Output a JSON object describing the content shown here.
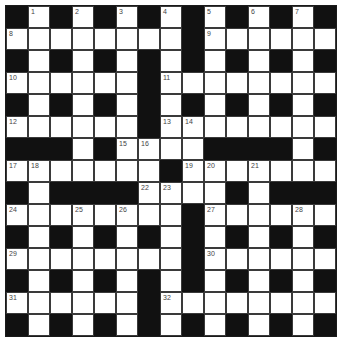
{
  "puzzle": {
    "size": 15,
    "rows": [
      "#.#.#.#.#.#.#.#",
      "........#......",
      "#.#.#.#.#.#.#.#",
      "......#........",
      "#.#.#.#.#.#.#.#",
      "......#........",
      "###.#....####.#",
      ".......#.......",
      "#.####....#.###",
      "........#......",
      "#.#.#.#.#.#.#.#",
      "........#......",
      "#.#.#.#.#.#.#.#",
      "......#........",
      "#.#.#.#.#.#.#.#"
    ],
    "numbers": [
      {
        "r": 0,
        "c": 1,
        "n": "1"
      },
      {
        "r": 0,
        "c": 3,
        "n": "2"
      },
      {
        "r": 0,
        "c": 5,
        "n": "3"
      },
      {
        "r": 0,
        "c": 7,
        "n": "4"
      },
      {
        "r": 0,
        "c": 9,
        "n": "5"
      },
      {
        "r": 0,
        "c": 11,
        "n": "6"
      },
      {
        "r": 0,
        "c": 13,
        "n": "7"
      },
      {
        "r": 1,
        "c": 0,
        "n": "8"
      },
      {
        "r": 1,
        "c": 9,
        "n": "9"
      },
      {
        "r": 3,
        "c": 0,
        "n": "10"
      },
      {
        "r": 3,
        "c": 7,
        "n": "11"
      },
      {
        "r": 5,
        "c": 0,
        "n": "12"
      },
      {
        "r": 5,
        "c": 7,
        "n": "13"
      },
      {
        "r": 5,
        "c": 8,
        "n": "14"
      },
      {
        "r": 6,
        "c": 5,
        "n": "15"
      },
      {
        "r": 6,
        "c": 6,
        "n": "16"
      },
      {
        "r": 7,
        "c": 0,
        "n": "17"
      },
      {
        "r": 7,
        "c": 1,
        "n": "18"
      },
      {
        "r": 7,
        "c": 8,
        "n": "19"
      },
      {
        "r": 7,
        "c": 9,
        "n": "20"
      },
      {
        "r": 7,
        "c": 11,
        "n": "21"
      },
      {
        "r": 8,
        "c": 6,
        "n": "22"
      },
      {
        "r": 8,
        "c": 7,
        "n": "23"
      },
      {
        "r": 9,
        "c": 0,
        "n": "24"
      },
      {
        "r": 9,
        "c": 3,
        "n": "25"
      },
      {
        "r": 9,
        "c": 5,
        "n": "26"
      },
      {
        "r": 9,
        "c": 9,
        "n": "27"
      },
      {
        "r": 9,
        "c": 13,
        "n": "28"
      },
      {
        "r": 11,
        "c": 0,
        "n": "29"
      },
      {
        "r": 11,
        "c": 9,
        "n": "30"
      },
      {
        "r": 13,
        "c": 0,
        "n": "31"
      },
      {
        "r": 13,
        "c": 7,
        "n": "32"
      }
    ],
    "colors": {
      "white_cell": "#ffffff",
      "black_cell": "#111111",
      "grid_line": "#3a3a3a"
    }
  }
}
